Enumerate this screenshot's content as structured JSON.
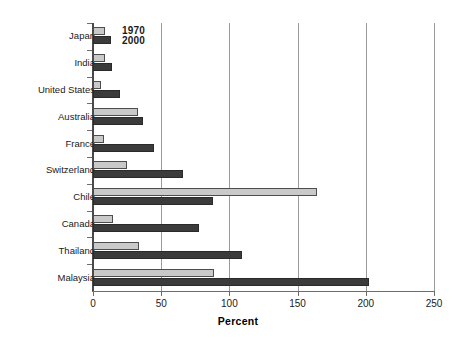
{
  "chart_data": {
    "type": "bar",
    "orientation": "horizontal",
    "title": "",
    "xlabel": "Percent",
    "ylabel": "",
    "xlim": [
      0,
      250
    ],
    "xticks": [
      0,
      50,
      100,
      150,
      200,
      250
    ],
    "xtick_labels": [
      "0",
      "50",
      "100",
      "150",
      "200",
      "250"
    ],
    "grid": "vertical",
    "legend_position": "inside-top-left",
    "categories": [
      "Japan",
      "India",
      "United States",
      "Australia",
      "France",
      "Switzerland",
      "Chile",
      "Canada",
      "Thailand",
      "Malaysia"
    ],
    "series": [
      {
        "name": "1970",
        "color": "#c9c9c9",
        "values": [
          9,
          9,
          6,
          33,
          8,
          25,
          164,
          15,
          34,
          89
        ]
      },
      {
        "name": "2000",
        "color": "#3b3b3b",
        "values": [
          13,
          14,
          20,
          37,
          45,
          66,
          88,
          78,
          109,
          202
        ]
      }
    ]
  },
  "legend": {
    "entries": [
      {
        "label": "1970"
      },
      {
        "label": "2000"
      }
    ]
  },
  "axis": {
    "x_title": "Percent"
  }
}
